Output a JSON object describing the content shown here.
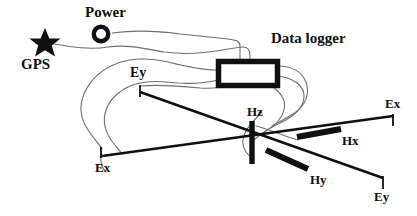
{
  "figure": {
    "width": 417,
    "height": 216,
    "background_color": "#ffffff",
    "ink_color": "#101010",
    "cable_color": "#6b6b6b"
  },
  "labels": {
    "power": "Power",
    "gps": "GPS",
    "data_logger": "Data logger",
    "ey_top_left": "Ey",
    "ex_right": "Ex",
    "hz": "Hz",
    "hx": "Hx",
    "ex_bottom_left": "Ex",
    "hy": "Hy",
    "ey_bottom_right": "Ey"
  },
  "components": [
    {
      "name": "gps-antenna",
      "label": "GPS",
      "shape": "star",
      "x": 45,
      "y": 42
    },
    {
      "name": "power-supply",
      "label": "Power",
      "shape": "ring",
      "x": 101,
      "y": 34
    },
    {
      "name": "data-logger",
      "label": "Data logger",
      "shape": "rectangle",
      "x": 247,
      "y": 73,
      "w": 62,
      "h": 27
    },
    {
      "name": "hz-coil",
      "label": "Hz",
      "shape": "vertical-bar",
      "x": 252,
      "y": 143
    },
    {
      "name": "hx-coil",
      "label": "Hx",
      "shape": "horizontal-bar",
      "x": 319,
      "y": 133
    },
    {
      "name": "hy-coil",
      "label": "Hy",
      "shape": "diagonal-bar",
      "x": 287,
      "y": 159
    },
    {
      "name": "ex-electrode-right",
      "label": "Ex",
      "shape": "electrode-stake",
      "x": 393,
      "y": 120
    },
    {
      "name": "ex-electrode-left",
      "label": "Ex",
      "shape": "electrode-stake",
      "x": 101,
      "y": 152
    },
    {
      "name": "ey-electrode-top",
      "label": "Ey",
      "shape": "electrode-stake",
      "x": 140,
      "y": 90
    },
    {
      "name": "ey-electrode-bottom",
      "label": "Ey",
      "shape": "electrode-stake",
      "x": 383,
      "y": 182
    }
  ],
  "dipoles": [
    {
      "name": "ex-dipole",
      "from": "ex-electrode-left",
      "to": "ex-electrode-right",
      "label": "Ex"
    },
    {
      "name": "ey-dipole",
      "from": "ey-electrode-top",
      "to": "ey-electrode-bottom",
      "label": "Ey"
    }
  ]
}
